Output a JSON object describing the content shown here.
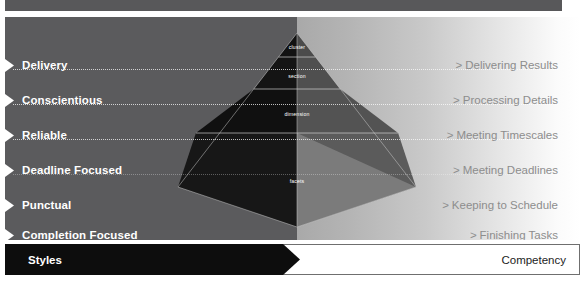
{
  "figure": {
    "axis": {
      "left_label": "Styles",
      "right_label": "Competency"
    },
    "rows": [
      {
        "style": "Delivery",
        "competency": "Delivering Results",
        "chevron": ">"
      },
      {
        "style": "Conscientious",
        "competency": "Processing Details",
        "chevron": ">"
      },
      {
        "style": "Reliable",
        "competency": "Meeting Timescales",
        "chevron": ">"
      },
      {
        "style": "Deadline Focused",
        "competency": "Meeting Deadlines",
        "chevron": ">"
      },
      {
        "style": "Punctual",
        "competency": "Keeping to Schedule",
        "chevron": ">"
      },
      {
        "style": "Completion Focused",
        "competency": "Finishing Tasks",
        "chevron": ">"
      }
    ],
    "pyramid": {
      "bands": [
        {
          "label": "cluster"
        },
        {
          "label": "section"
        },
        {
          "label": "dimension"
        },
        {
          "label": "facets"
        }
      ]
    },
    "colors": {
      "left_panel": "#5b5b5d",
      "right_panel_start": "#a9a9a9",
      "right_panel_end": "#ffffff",
      "top_band": "#58585a",
      "axis_black": "#0d0d0d",
      "axis_white": "#ffffff",
      "style_text": "#ffffff",
      "competency_text": "#8d8d8d",
      "pyramid_dark": "#141414",
      "pyramid_mid": "#3a3a3a",
      "pyramid_light": "#6e6e6e",
      "pyramid_pale": "#8f8f8f"
    }
  }
}
